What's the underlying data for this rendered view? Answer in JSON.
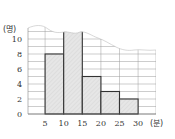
{
  "chart_data": {
    "type": "bar",
    "subtype": "histogram",
    "title": "",
    "xlabel": "(분)",
    "ylabel": "(명)",
    "x_ticks": [
      5,
      10,
      15,
      20,
      25,
      30
    ],
    "y_ticks": [
      0,
      2,
      4,
      6,
      8,
      10
    ],
    "ylim": [
      0,
      11
    ],
    "xlim": [
      0,
      30
    ],
    "grid": true,
    "categories": [
      "5~10",
      "10~15",
      "15~20",
      "20~25",
      "25~30"
    ],
    "bins": [
      [
        5,
        10
      ],
      [
        10,
        15
      ],
      [
        15,
        20
      ],
      [
        20,
        25
      ],
      [
        25,
        30
      ]
    ],
    "values": [
      8,
      null,
      5,
      3,
      2
    ],
    "annotations": [
      "10~15 bar is obscured by torn top edge (value hidden, greater than 10)"
    ],
    "legend": null
  },
  "labels": {
    "y_unit": "(명)",
    "x_unit": "(분)"
  },
  "colors": {
    "bar_fill": "#e4e4e4",
    "bar_stroke": "#333333",
    "grid": "#9a9a9a"
  }
}
